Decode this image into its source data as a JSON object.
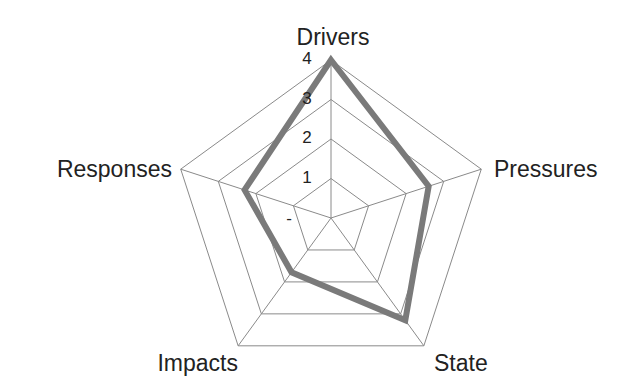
{
  "chart_data": {
    "type": "radar",
    "title": "",
    "axes": [
      "Drivers",
      "Pressures",
      "State",
      "Impacts",
      "Responses"
    ],
    "categories": [
      "Drivers",
      "Pressures",
      "State",
      "Impacts",
      "Responses"
    ],
    "series": [
      {
        "name": "",
        "values": [
          4.0,
          2.6,
          3.2,
          1.7,
          2.3
        ],
        "color": "#7a7a7a"
      }
    ],
    "values": [
      4.0,
      2.6,
      3.2,
      1.7,
      2.3
    ],
    "tick_labels": [
      "-",
      "1",
      "2",
      "3",
      "4"
    ],
    "tick_values": [
      0,
      1,
      2,
      3,
      4
    ],
    "rlim": [
      0,
      4
    ],
    "grid": true,
    "legend": "none"
  },
  "style": {
    "grid_color": "#8a8a8a",
    "line_color": "#7a7a7a",
    "label_color": "#222222"
  },
  "layout": {
    "center": [
      331,
      218
    ],
    "radius": 158
  }
}
